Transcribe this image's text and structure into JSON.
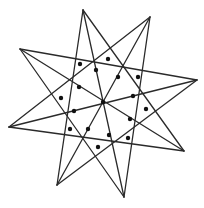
{
  "figure": {
    "type": "octagram-star-diagram",
    "line_color": "#2a2a2a",
    "dot_color": "#111111",
    "background": "#ffffff",
    "tips": [
      {
        "id": "T0",
        "name": "top",
        "x": 83,
        "y": 10
      },
      {
        "id": "T1",
        "name": "top-right",
        "x": 150,
        "y": 17
      },
      {
        "id": "T2",
        "name": "right",
        "x": 197,
        "y": 80
      },
      {
        "id": "T3",
        "name": "bottom-right",
        "x": 184,
        "y": 151
      },
      {
        "id": "T4",
        "name": "bottom",
        "x": 124,
        "y": 197
      },
      {
        "id": "T5",
        "name": "bottom-left",
        "x": 57,
        "y": 185
      },
      {
        "id": "T6",
        "name": "left",
        "x": 9,
        "y": 127
      },
      {
        "id": "T7",
        "name": "top-left",
        "x": 20,
        "y": 49
      }
    ],
    "segments": [
      [
        "T0",
        "T4"
      ],
      [
        "T1",
        "T5"
      ],
      [
        "T2",
        "T6"
      ],
      [
        "T3",
        "T7"
      ],
      [
        "T0",
        "T3"
      ],
      [
        "T0",
        "T5"
      ],
      [
        "T1",
        "T4"
      ],
      [
        "T1",
        "T6"
      ],
      [
        "T2",
        "T5"
      ],
      [
        "T2",
        "T7"
      ],
      [
        "T3",
        "T6"
      ],
      [
        "T4",
        "T7"
      ]
    ],
    "dots": [
      {
        "x": 80,
        "y": 64
      },
      {
        "x": 108,
        "y": 59
      },
      {
        "x": 96,
        "y": 70
      },
      {
        "x": 118,
        "y": 77
      },
      {
        "x": 138,
        "y": 77
      },
      {
        "x": 79,
        "y": 87
      },
      {
        "x": 61,
        "y": 98
      },
      {
        "x": 103,
        "y": 102
      },
      {
        "x": 133,
        "y": 96
      },
      {
        "x": 74,
        "y": 111
      },
      {
        "x": 146,
        "y": 109
      },
      {
        "x": 130,
        "y": 119
      },
      {
        "x": 70,
        "y": 129
      },
      {
        "x": 88,
        "y": 129
      },
      {
        "x": 109,
        "y": 135
      },
      {
        "x": 128,
        "y": 138
      },
      {
        "x": 98,
        "y": 147
      }
    ]
  }
}
